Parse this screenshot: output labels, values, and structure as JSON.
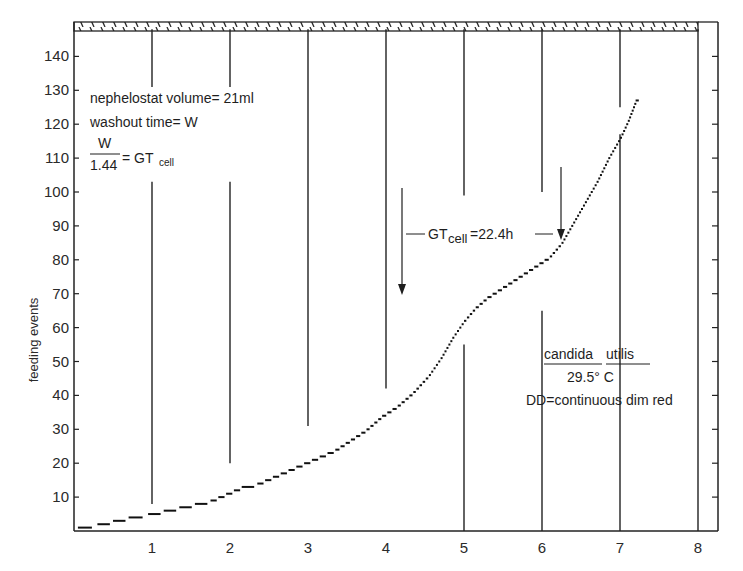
{
  "chart_data": {
    "type": "line",
    "title": "",
    "xlabel": "",
    "ylabel": "feeding events",
    "xlim": [
      0,
      8.3
    ],
    "ylim": [
      0,
      148
    ],
    "x_ticks": [
      1,
      2,
      3,
      4,
      5,
      6,
      7,
      8
    ],
    "y_ticks": [
      10,
      20,
      30,
      40,
      50,
      60,
      70,
      80,
      90,
      100,
      110,
      120,
      130,
      140
    ],
    "grid": false,
    "legend": null,
    "series": [
      {
        "name": "feeding events (cumulative, stepwise)",
        "x": [
          0.05,
          0.3,
          0.5,
          0.7,
          0.95,
          1.15,
          1.35,
          1.55,
          1.75,
          1.95,
          2.15,
          2.35,
          2.55,
          2.75,
          2.95,
          3.15,
          3.35,
          3.55,
          3.75,
          3.95,
          4.15,
          4.35,
          4.55,
          4.7,
          4.85,
          5.0,
          5.15,
          5.3,
          5.5,
          5.7,
          5.9,
          6.1,
          6.25,
          6.4,
          6.55,
          6.7,
          6.85,
          7.0,
          7.1,
          7.2
        ],
        "y": [
          1,
          2,
          3,
          4,
          5,
          6,
          7,
          8,
          9,
          11,
          13,
          14,
          16,
          18,
          20,
          22,
          24,
          27,
          30,
          34,
          37,
          41,
          46,
          51,
          57,
          62,
          66,
          69,
          72,
          75,
          78,
          81,
          85,
          91,
          97,
          103,
          110,
          116,
          121,
          127
        ]
      }
    ],
    "day_lines": {
      "description": "vertical lines at each day boundary, interrupted by gaps",
      "segments": [
        {
          "x": 1,
          "spans": [
            [
              131,
              148
            ],
            [
              8,
              103
            ]
          ]
        },
        {
          "x": 2,
          "spans": [
            [
              131,
              148
            ],
            [
              20,
              103
            ]
          ]
        },
        {
          "x": 3,
          "spans": [
            [
              31,
              148
            ]
          ]
        },
        {
          "x": 4,
          "spans": [
            [
              42,
              148
            ]
          ]
        },
        {
          "x": 5,
          "spans": [
            [
              99,
              148
            ],
            [
              0,
              55
            ]
          ]
        },
        {
          "x": 6,
          "spans": [
            [
              100,
              148
            ],
            [
              0,
              65
            ]
          ]
        },
        {
          "x": 7,
          "spans": [
            [
              125,
              148
            ],
            [
              0,
              117
            ]
          ]
        },
        {
          "x": 8,
          "spans": [
            [
              0,
              148
            ]
          ]
        }
      ]
    },
    "hatched_bar": {
      "from_x": 0,
      "to_x": 8,
      "label": "continuous dim red light (DD)"
    },
    "annotations": [
      {
        "text": "nephelostat volume= 21ml"
      },
      {
        "text": "washout time= W"
      },
      {
        "text": "W / 1.44 = GT_cell"
      },
      {
        "text": "GT_cell=22.4h",
        "arrows_at_x": [
          4.2,
          6.25
        ]
      },
      {
        "text": "candida utilis"
      },
      {
        "text": "29.5° C"
      },
      {
        "text": "DD=continuous dim red"
      }
    ]
  },
  "labels": {
    "ylabel": "feeding events",
    "x_ticks": [
      "1",
      "2",
      "3",
      "4",
      "5",
      "6",
      "7",
      "8"
    ],
    "y_ticks": [
      "10",
      "20",
      "30",
      "40",
      "50",
      "60",
      "70",
      "80",
      "90",
      "100",
      "110",
      "120",
      "130",
      "140"
    ],
    "neph_volume": "nephelostat volume= 21ml",
    "washout": "washout time= W",
    "frac_num": "W",
    "frac_den": "1.44",
    "frac_eq": "= GT",
    "frac_sub": "cell",
    "gt_prefix": "GT",
    "gt_sub": "cell",
    "gt_value": "=22.4h",
    "species_1": "candida",
    "species_2": "utilis",
    "temperature": "29.5° C",
    "dd": "DD=continuous dim red"
  }
}
